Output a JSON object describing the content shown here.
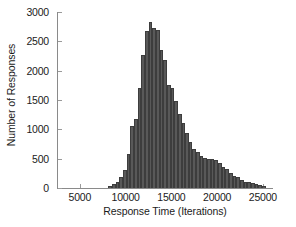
{
  "chart_data": {
    "type": "bar",
    "title": "",
    "subtitle": "",
    "xlabel": "Response Time (Iterations)",
    "ylabel": "Number of Responses",
    "xlim": [
      2500,
      26000
    ],
    "ylim": [
      0,
      3000
    ],
    "grid": false,
    "legend": null,
    "bin_width": 400,
    "xticks": [
      5000,
      10000,
      15000,
      20000,
      25000
    ],
    "xtick_labels": [
      "5000",
      "10000",
      "15000",
      "20000",
      "25000"
    ],
    "yticks": [
      0,
      500,
      1000,
      1500,
      2000,
      2500,
      3000
    ],
    "ytick_labels": [
      "0",
      "500",
      "1000",
      "1500",
      "2000",
      "2500",
      "3000"
    ],
    "bin_centers": [
      8200,
      8600,
      9000,
      9400,
      9800,
      10200,
      10600,
      11000,
      11400,
      11800,
      12200,
      12600,
      13000,
      13400,
      13800,
      14200,
      14600,
      15000,
      15400,
      15800,
      16200,
      16600,
      17000,
      17400,
      17800,
      18200,
      18600,
      19000,
      19400,
      19800,
      20200,
      20600,
      21000,
      21400,
      21800,
      22200,
      22600,
      23000,
      23400,
      23800,
      24200,
      24600,
      25000
    ],
    "values": [
      30,
      60,
      110,
      190,
      300,
      580,
      1060,
      1180,
      1700,
      2260,
      2670,
      2830,
      2720,
      2700,
      2350,
      2190,
      1750,
      1700,
      1490,
      1270,
      1100,
      930,
      790,
      670,
      610,
      540,
      510,
      500,
      490,
      470,
      420,
      360,
      330,
      250,
      200,
      190,
      130,
      110,
      100,
      80,
      60,
      50,
      30
    ],
    "bar_color": "#595959",
    "bar_edge_color": "#3d3d3d",
    "axis_color": "#8a8a8a",
    "text_color": "#1b1b1b",
    "background_color": "#ffffff"
  }
}
